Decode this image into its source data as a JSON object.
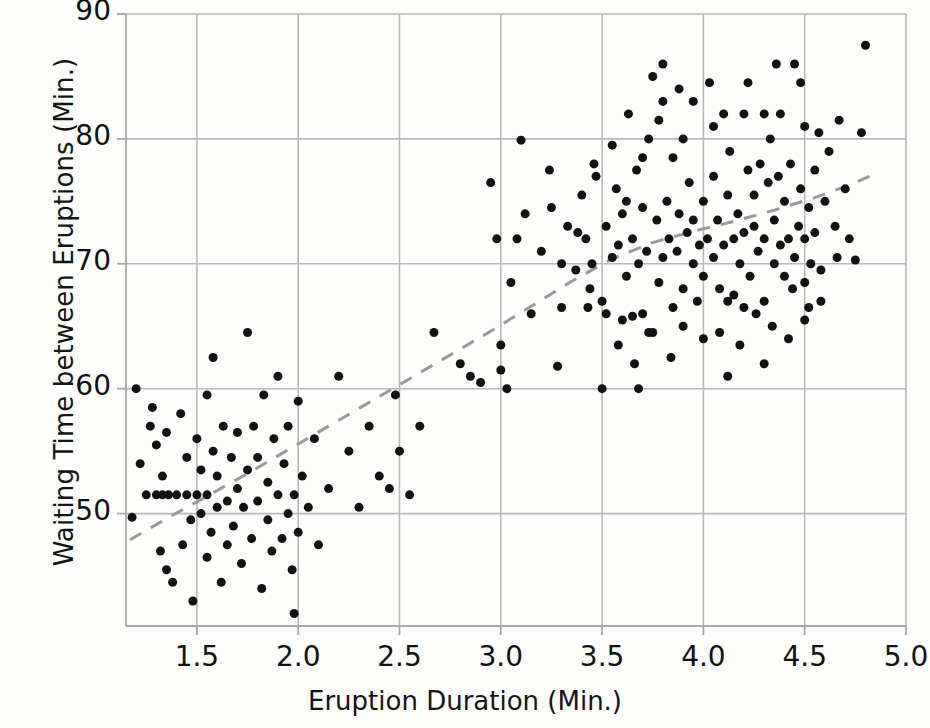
{
  "chart_data": {
    "type": "scatter",
    "title": "",
    "subtitle": "",
    "xlabel": "Eruption Duration (Min.)",
    "ylabel": "Waiting Time between Eruptions (Min.)",
    "xlim": [
      1.15,
      5.0
    ],
    "ylim": [
      41.0,
      90.0
    ],
    "xticks": [
      "1.5",
      "2.0",
      "2.5",
      "3.0",
      "3.5",
      "4.0",
      "4.5",
      "5.0"
    ],
    "xtick_values": [
      1.5,
      2.0,
      2.5,
      3.0,
      3.5,
      4.0,
      4.5,
      5.0
    ],
    "yticks": [
      "50",
      "60",
      "70",
      "80",
      "90"
    ],
    "ytick_values": [
      50,
      60,
      70,
      80,
      90
    ],
    "grid": true,
    "legend": "none",
    "marker": {
      "shape": "circle",
      "color": "#121212",
      "size_px": 9
    },
    "colors": {
      "background": "#fdfdfc",
      "grid": "#b9b9b9",
      "axis": "#a8a8a8",
      "marker": "#121212",
      "trendline": "#9a9a9a",
      "text": "#141414"
    },
    "trendline": {
      "style": "dashed",
      "color": "#9a9a9a",
      "width_px": 3,
      "description": "LOESS smoother through the bimodal cloud",
      "points": [
        [
          1.17,
          47.9
        ],
        [
          1.35,
          49.6
        ],
        [
          1.55,
          51.4
        ],
        [
          1.75,
          53.2
        ],
        [
          1.95,
          55.1
        ],
        [
          2.15,
          57.0
        ],
        [
          2.35,
          58.9
        ],
        [
          2.55,
          60.8
        ],
        [
          2.75,
          62.7
        ],
        [
          2.95,
          64.6
        ],
        [
          3.15,
          66.6
        ],
        [
          3.35,
          68.6
        ],
        [
          3.55,
          70.4
        ],
        [
          3.75,
          71.7
        ],
        [
          3.95,
          72.6
        ],
        [
          4.15,
          73.4
        ],
        [
          4.35,
          74.3
        ],
        [
          4.55,
          75.3
        ],
        [
          4.72,
          76.3
        ],
        [
          4.82,
          77.0
        ]
      ]
    },
    "series": [
      {
        "name": "Old Faithful eruptions",
        "points": [
          [
            1.18,
            49.7
          ],
          [
            1.2,
            60.0
          ],
          [
            1.22,
            54.0
          ],
          [
            1.25,
            51.5
          ],
          [
            1.27,
            57.0
          ],
          [
            1.28,
            58.5
          ],
          [
            1.3,
            51.5
          ],
          [
            1.3,
            55.5
          ],
          [
            1.32,
            47.0
          ],
          [
            1.33,
            51.5
          ],
          [
            1.33,
            53.0
          ],
          [
            1.35,
            45.5
          ],
          [
            1.35,
            56.5
          ],
          [
            1.36,
            51.5
          ],
          [
            1.38,
            44.5
          ],
          [
            1.4,
            51.5
          ],
          [
            1.42,
            58.0
          ],
          [
            1.43,
            47.5
          ],
          [
            1.45,
            51.5
          ],
          [
            1.45,
            54.5
          ],
          [
            1.47,
            49.5
          ],
          [
            1.48,
            43.0
          ],
          [
            1.5,
            51.5
          ],
          [
            1.5,
            56.0
          ],
          [
            1.52,
            50.0
          ],
          [
            1.52,
            53.5
          ],
          [
            1.55,
            46.5
          ],
          [
            1.55,
            51.5
          ],
          [
            1.55,
            59.5
          ],
          [
            1.57,
            48.5
          ],
          [
            1.58,
            55.0
          ],
          [
            1.58,
            62.5
          ],
          [
            1.6,
            50.5
          ],
          [
            1.6,
            53.0
          ],
          [
            1.62,
            44.5
          ],
          [
            1.63,
            57.0
          ],
          [
            1.65,
            47.5
          ],
          [
            1.65,
            51.0
          ],
          [
            1.67,
            54.5
          ],
          [
            1.68,
            49.0
          ],
          [
            1.7,
            52.0
          ],
          [
            1.7,
            56.5
          ],
          [
            1.72,
            46.0
          ],
          [
            1.73,
            50.5
          ],
          [
            1.75,
            53.5
          ],
          [
            1.75,
            64.5
          ],
          [
            1.77,
            48.0
          ],
          [
            1.78,
            57.0
          ],
          [
            1.8,
            51.0
          ],
          [
            1.8,
            54.5
          ],
          [
            1.82,
            44.0
          ],
          [
            1.83,
            59.5
          ],
          [
            1.85,
            49.5
          ],
          [
            1.85,
            52.5
          ],
          [
            1.87,
            47.0
          ],
          [
            1.88,
            56.0
          ],
          [
            1.9,
            51.5
          ],
          [
            1.9,
            61.0
          ],
          [
            1.92,
            48.0
          ],
          [
            1.93,
            54.0
          ],
          [
            1.95,
            50.0
          ],
          [
            1.95,
            57.0
          ],
          [
            1.97,
            45.5
          ],
          [
            1.98,
            51.5
          ],
          [
            1.98,
            42.0
          ],
          [
            2.0,
            48.5
          ],
          [
            2.0,
            59.0
          ],
          [
            2.02,
            53.0
          ],
          [
            2.05,
            50.5
          ],
          [
            2.08,
            56.0
          ],
          [
            2.1,
            47.5
          ],
          [
            2.15,
            52.0
          ],
          [
            2.2,
            61.0
          ],
          [
            2.25,
            55.0
          ],
          [
            2.3,
            50.5
          ],
          [
            2.35,
            57.0
          ],
          [
            2.4,
            53.0
          ],
          [
            2.45,
            52.0
          ],
          [
            2.48,
            59.5
          ],
          [
            2.5,
            55.0
          ],
          [
            2.55,
            51.5
          ],
          [
            2.6,
            57.0
          ],
          [
            2.67,
            64.5
          ],
          [
            2.8,
            62.0
          ],
          [
            2.9,
            60.5
          ],
          [
            2.95,
            76.5
          ],
          [
            3.0,
            61.5
          ],
          [
            3.0,
            63.5
          ],
          [
            3.03,
            60.0
          ],
          [
            3.05,
            68.5
          ],
          [
            3.08,
            72.0
          ],
          [
            3.1,
            79.9
          ],
          [
            3.15,
            66.0
          ],
          [
            3.2,
            71.0
          ],
          [
            3.25,
            74.5
          ],
          [
            3.28,
            61.8
          ],
          [
            3.3,
            66.5
          ],
          [
            3.33,
            73.0
          ],
          [
            3.37,
            69.5
          ],
          [
            3.4,
            75.5
          ],
          [
            3.42,
            72.0
          ],
          [
            3.45,
            70.0
          ],
          [
            3.47,
            77.0
          ],
          [
            3.5,
            60.0
          ],
          [
            3.5,
            67.0
          ],
          [
            3.52,
            73.0
          ],
          [
            3.55,
            70.5
          ],
          [
            3.57,
            76.0
          ],
          [
            3.58,
            71.5
          ],
          [
            3.6,
            65.5
          ],
          [
            3.6,
            74.0
          ],
          [
            3.62,
            69.0
          ],
          [
            3.63,
            82.0
          ],
          [
            3.65,
            65.8
          ],
          [
            3.65,
            72.0
          ],
          [
            3.67,
            77.5
          ],
          [
            3.68,
            70.0
          ],
          [
            3.7,
            66.0
          ],
          [
            3.7,
            74.5
          ],
          [
            3.72,
            71.0
          ],
          [
            3.73,
            80.0
          ],
          [
            3.75,
            64.5
          ],
          [
            3.75,
            85.0
          ],
          [
            3.77,
            73.5
          ],
          [
            3.78,
            68.5
          ],
          [
            3.8,
            70.5
          ],
          [
            3.8,
            83.0
          ],
          [
            3.82,
            75.0
          ],
          [
            3.83,
            72.0
          ],
          [
            3.85,
            66.5
          ],
          [
            3.85,
            78.5
          ],
          [
            3.87,
            71.0
          ],
          [
            3.88,
            74.0
          ],
          [
            3.9,
            68.0
          ],
          [
            3.9,
            80.0
          ],
          [
            3.92,
            72.5
          ],
          [
            3.93,
            76.5
          ],
          [
            3.95,
            70.0
          ],
          [
            3.95,
            73.5
          ],
          [
            3.97,
            67.0
          ],
          [
            3.98,
            71.5
          ],
          [
            4.0,
            69.0
          ],
          [
            4.0,
            75.0
          ],
          [
            4.02,
            72.0
          ],
          [
            4.03,
            84.5
          ],
          [
            4.05,
            77.0
          ],
          [
            4.05,
            70.5
          ],
          [
            4.07,
            73.5
          ],
          [
            4.08,
            68.0
          ],
          [
            4.1,
            71.5
          ],
          [
            4.1,
            82.0
          ],
          [
            4.12,
            75.5
          ],
          [
            4.13,
            79.0
          ],
          [
            4.15,
            72.0
          ],
          [
            4.15,
            67.5
          ],
          [
            4.17,
            74.0
          ],
          [
            4.18,
            70.0
          ],
          [
            4.2,
            72.5
          ],
          [
            4.2,
            82.0
          ],
          [
            4.22,
            77.5
          ],
          [
            4.23,
            69.0
          ],
          [
            4.25,
            73.0
          ],
          [
            4.25,
            75.5
          ],
          [
            4.27,
            71.0
          ],
          [
            4.28,
            78.0
          ],
          [
            4.3,
            67.0
          ],
          [
            4.3,
            72.0
          ],
          [
            4.32,
            76.5
          ],
          [
            4.33,
            80.0
          ],
          [
            4.35,
            70.0
          ],
          [
            4.35,
            73.5
          ],
          [
            4.37,
            77.0
          ],
          [
            4.38,
            71.5
          ],
          [
            4.4,
            69.0
          ],
          [
            4.4,
            75.0
          ],
          [
            4.42,
            72.0
          ],
          [
            4.43,
            78.0
          ],
          [
            4.45,
            70.5
          ],
          [
            4.45,
            86.0
          ],
          [
            4.47,
            73.0
          ],
          [
            4.48,
            76.0
          ],
          [
            4.5,
            68.5
          ],
          [
            4.5,
            72.0
          ],
          [
            4.5,
            81.0
          ],
          [
            4.52,
            74.5
          ],
          [
            4.53,
            70.0
          ],
          [
            4.55,
            77.5
          ],
          [
            4.55,
            72.5
          ],
          [
            4.57,
            80.5
          ],
          [
            4.58,
            69.5
          ],
          [
            4.6,
            75.0
          ],
          [
            4.62,
            79.0
          ],
          [
            4.65,
            73.0
          ],
          [
            4.67,
            81.5
          ],
          [
            4.7,
            76.0
          ],
          [
            4.72,
            72.0
          ],
          [
            4.75,
            70.3
          ],
          [
            4.78,
            80.5
          ],
          [
            4.8,
            87.5
          ],
          [
            3.43,
            66.5
          ],
          [
            3.46,
            78.0
          ],
          [
            3.55,
            79.5
          ],
          [
            3.62,
            75.0
          ],
          [
            3.7,
            78.5
          ],
          [
            3.78,
            81.5
          ],
          [
            3.88,
            84.0
          ],
          [
            4.05,
            81.0
          ],
          [
            4.12,
            67.0
          ],
          [
            4.2,
            66.5
          ],
          [
            4.3,
            82.0
          ],
          [
            4.38,
            82.0
          ],
          [
            4.44,
            68.0
          ],
          [
            4.52,
            66.5
          ],
          [
            3.3,
            70.0
          ],
          [
            3.38,
            72.5
          ],
          [
            3.44,
            68.0
          ],
          [
            3.52,
            66.0
          ],
          [
            3.58,
            63.5
          ],
          [
            3.66,
            62.0
          ],
          [
            3.73,
            64.5
          ],
          [
            3.84,
            62.5
          ],
          [
            3.9,
            65.0
          ],
          [
            4.0,
            64.0
          ],
          [
            4.08,
            64.5
          ],
          [
            4.18,
            63.5
          ],
          [
            4.26,
            66.0
          ],
          [
            4.34,
            65.0
          ],
          [
            4.42,
            64.0
          ],
          [
            4.5,
            65.5
          ],
          [
            4.58,
            67.0
          ],
          [
            4.66,
            70.5
          ],
          [
            2.85,
            61.0
          ],
          [
            2.98,
            72.0
          ],
          [
            3.12,
            74.0
          ],
          [
            3.24,
            77.5
          ],
          [
            3.8,
            86.0
          ],
          [
            3.95,
            83.0
          ],
          [
            4.22,
            84.5
          ],
          [
            4.36,
            86.0
          ],
          [
            4.48,
            84.5
          ],
          [
            3.68,
            60.0
          ],
          [
            4.12,
            61.0
          ],
          [
            4.3,
            62.0
          ]
        ]
      }
    ]
  },
  "axes": {
    "x_title": "Eruption Duration (Min.)",
    "y_title": "Waiting Time between Eruptions (Min.)"
  }
}
